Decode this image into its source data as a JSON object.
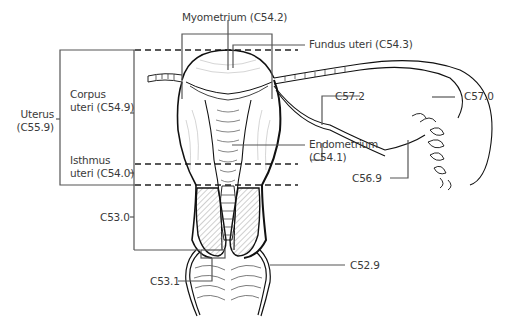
{
  "diagram": {
    "colors": {
      "line": "#222222",
      "leader": "#555555",
      "text": "#3a3a3a",
      "hatch": "#777777"
    },
    "labels": {
      "myometrium": "Myometrium (C54.2)",
      "fundus": "Fundus uteri (C54.3)",
      "uterus_line1": "Uterus",
      "uterus_line2": "(C55.9)",
      "corpus_line1": "Corpus",
      "corpus_line2": "uteri (C54.9)",
      "isthmus_line1": "Isthmus",
      "isthmus_line2": "uteri (C54.0)",
      "endometrium_line1": "Endometrium",
      "endometrium_line2": "(C54.1)",
      "c57_2": "C57.2",
      "c57_0": "C57.0",
      "c56_9": "C56.9",
      "c53_0": "C53.0",
      "c53_1": "C53.1",
      "c52_9": "C52.9"
    }
  }
}
